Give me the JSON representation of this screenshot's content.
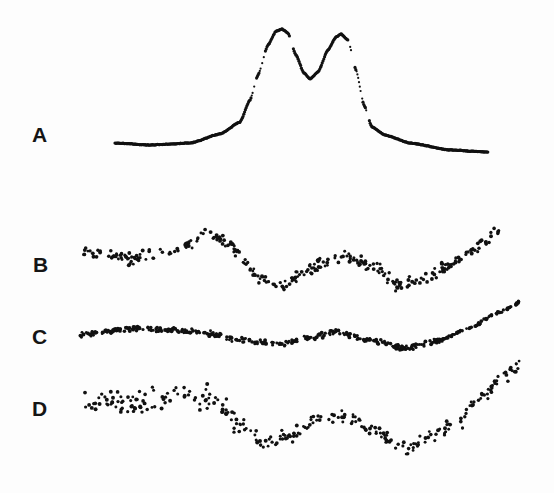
{
  "chart_data": [
    {
      "panel": "A",
      "type": "scatter",
      "description": "Smooth doublet spectrum with two peaks",
      "x_range": [
        115,
        488
      ],
      "baseline_y": 144,
      "peaks": [
        {
          "x": 282,
          "y": 29
        },
        {
          "x": 341,
          "y": 34
        }
      ],
      "valley": {
        "x": 310,
        "y": 79
      },
      "curve": [
        [
          115,
          143
        ],
        [
          150,
          145
        ],
        [
          190,
          143
        ],
        [
          220,
          134
        ],
        [
          240,
          122
        ],
        [
          250,
          100
        ],
        [
          258,
          75
        ],
        [
          268,
          45
        ],
        [
          276,
          31
        ],
        [
          282,
          29
        ],
        [
          288,
          33
        ],
        [
          296,
          55
        ],
        [
          304,
          73
        ],
        [
          310,
          79
        ],
        [
          318,
          72
        ],
        [
          328,
          50
        ],
        [
          336,
          37
        ],
        [
          341,
          34
        ],
        [
          348,
          40
        ],
        [
          356,
          70
        ],
        [
          364,
          105
        ],
        [
          372,
          127
        ],
        [
          385,
          135
        ],
        [
          410,
          143
        ],
        [
          450,
          150
        ],
        [
          488,
          152
        ]
      ]
    },
    {
      "panel": "B",
      "type": "scatter",
      "description": "Noisy trace, moderate scatter",
      "x_range": [
        83,
        500
      ],
      "trend": [
        [
          83,
          250
        ],
        [
          130,
          258
        ],
        [
          180,
          250
        ],
        [
          205,
          232
        ],
        [
          230,
          245
        ],
        [
          260,
          278
        ],
        [
          285,
          285
        ],
        [
          310,
          268
        ],
        [
          345,
          255
        ],
        [
          375,
          268
        ],
        [
          400,
          287
        ],
        [
          425,
          278
        ],
        [
          455,
          262
        ],
        [
          480,
          245
        ],
        [
          500,
          228
        ]
      ],
      "noise": 9
    },
    {
      "panel": "C",
      "type": "scatter",
      "description": "Low-noise trace",
      "x_range": [
        80,
        520
      ],
      "trend": [
        [
          80,
          334
        ],
        [
          140,
          328
        ],
        [
          200,
          332
        ],
        [
          240,
          340
        ],
        [
          280,
          344
        ],
        [
          310,
          338
        ],
        [
          335,
          332
        ],
        [
          370,
          340
        ],
        [
          405,
          348
        ],
        [
          440,
          340
        ],
        [
          470,
          328
        ],
        [
          500,
          312
        ],
        [
          520,
          302
        ]
      ],
      "noise": 4
    },
    {
      "panel": "D",
      "type": "scatter",
      "description": "Noisy trace, high scatter",
      "x_range": [
        83,
        522
      ],
      "trend": [
        [
          83,
          400
        ],
        [
          130,
          405
        ],
        [
          180,
          395
        ],
        [
          215,
          400
        ],
        [
          245,
          428
        ],
        [
          265,
          445
        ],
        [
          290,
          435
        ],
        [
          320,
          418
        ],
        [
          345,
          418
        ],
        [
          375,
          430
        ],
        [
          405,
          448
        ],
        [
          430,
          438
        ],
        [
          460,
          422
        ],
        [
          480,
          398
        ],
        [
          500,
          380
        ],
        [
          522,
          365
        ]
      ],
      "noise": 18
    }
  ],
  "labels": {
    "a": "A",
    "b": "B",
    "c": "C",
    "d": "D"
  }
}
